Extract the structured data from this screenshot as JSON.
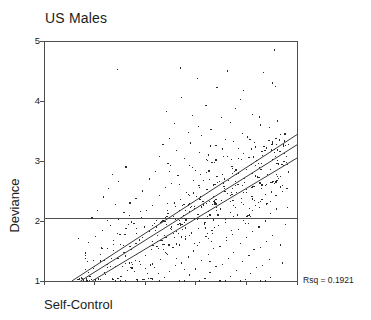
{
  "chart_data": {
    "type": "scatter",
    "title": "US Males",
    "xlabel": "Self-Control",
    "ylabel": "Deviance",
    "annotation": "Rsq = 0.1921",
    "rsq": 0.1921,
    "grid": false,
    "legend": "none",
    "xlim": [
      0,
      5
    ],
    "ylim": [
      1,
      5
    ],
    "x_tick_labels": [
      "",
      "",
      "",
      "",
      "",
      ""
    ],
    "x_tick_values": [
      0,
      1,
      2,
      3,
      4,
      5
    ],
    "y_tick_labels": [
      "1",
      "2",
      "3",
      "4",
      "5"
    ],
    "y_tick_values": [
      1,
      2,
      3,
      4,
      5
    ],
    "reference_lines": [
      {
        "name": "horizontal-mean-line",
        "orientation": "horizontal",
        "y": 2.04
      }
    ],
    "fit_lines": [
      {
        "name": "regression-line-upper",
        "x1": 0.55,
        "y1": 1.0,
        "x2": 5.0,
        "y2": 3.44
      },
      {
        "name": "regression-line-center",
        "x1": 0.72,
        "y1": 1.0,
        "x2": 5.0,
        "y2": 3.27
      },
      {
        "name": "regression-line-lower",
        "x1": 0.95,
        "y1": 1.0,
        "x2": 5.0,
        "y2": 3.05
      }
    ],
    "point_count": 546,
    "points": [
      [
        4.55,
        4.85
      ],
      [
        1.45,
        4.52
      ],
      [
        2.7,
        4.55
      ],
      [
        3.62,
        4.5
      ],
      [
        4.33,
        4.48
      ],
      [
        3.03,
        4.38
      ],
      [
        4.52,
        4.3
      ],
      [
        4.58,
        4.24
      ],
      [
        3.42,
        4.22
      ],
      [
        3.95,
        4.18
      ],
      [
        5.0,
        4.16
      ],
      [
        2.72,
        4.06
      ],
      [
        3.88,
        4.02
      ],
      [
        2.42,
        3.82
      ],
      [
        3.2,
        3.92
      ],
      [
        3.78,
        3.88
      ],
      [
        2.93,
        3.76
      ],
      [
        3.5,
        3.72
      ],
      [
        4.12,
        3.78
      ],
      [
        2.58,
        3.62
      ],
      [
        3.05,
        3.58
      ],
      [
        3.68,
        3.64
      ],
      [
        4.28,
        3.6
      ],
      [
        2.85,
        3.48
      ],
      [
        3.3,
        3.52
      ],
      [
        3.92,
        3.46
      ],
      [
        2.48,
        3.38
      ],
      [
        3.12,
        3.42
      ],
      [
        3.58,
        3.36
      ],
      [
        4.02,
        3.4
      ],
      [
        2.35,
        3.28
      ],
      [
        2.9,
        3.3
      ],
      [
        3.4,
        3.26
      ],
      [
        3.75,
        3.32
      ],
      [
        4.18,
        3.24
      ],
      [
        2.62,
        3.18
      ],
      [
        3.08,
        3.14
      ],
      [
        3.52,
        3.2
      ],
      [
        3.95,
        3.12
      ],
      [
        2.28,
        3.08
      ],
      [
        2.78,
        3.04
      ],
      [
        3.25,
        3.1
      ],
      [
        3.7,
        3.02
      ],
      [
        4.05,
        3.06
      ],
      [
        1.62,
        2.9
      ],
      [
        2.45,
        2.96
      ],
      [
        2.88,
        2.92
      ],
      [
        3.32,
        2.98
      ],
      [
        3.72,
        2.88
      ],
      [
        4.1,
        2.94
      ],
      [
        4.48,
        2.86
      ],
      [
        1.35,
        2.78
      ],
      [
        2.2,
        2.82
      ],
      [
        2.65,
        2.76
      ],
      [
        3.0,
        2.84
      ],
      [
        3.42,
        2.74
      ],
      [
        3.85,
        2.8
      ],
      [
        4.25,
        2.72
      ],
      [
        1.48,
        2.66
      ],
      [
        2.08,
        2.7
      ],
      [
        2.52,
        2.62
      ],
      [
        2.95,
        2.68
      ],
      [
        3.35,
        2.6
      ],
      [
        3.78,
        2.66
      ],
      [
        4.15,
        2.58
      ],
      [
        4.52,
        2.64
      ],
      [
        1.28,
        2.54
      ],
      [
        1.95,
        2.5
      ],
      [
        2.4,
        2.56
      ],
      [
        2.82,
        2.48
      ],
      [
        3.22,
        2.52
      ],
      [
        3.62,
        2.46
      ],
      [
        4.0,
        2.52
      ],
      [
        4.38,
        2.44
      ],
      [
        1.18,
        2.4
      ],
      [
        1.82,
        2.38
      ],
      [
        2.28,
        2.42
      ],
      [
        2.7,
        2.36
      ],
      [
        3.1,
        2.4
      ],
      [
        3.5,
        2.34
      ],
      [
        3.9,
        2.38
      ],
      [
        4.28,
        2.32
      ],
      [
        1.42,
        2.28
      ],
      [
        1.7,
        2.3
      ],
      [
        2.15,
        2.26
      ],
      [
        2.58,
        2.3
      ],
      [
        2.98,
        2.24
      ],
      [
        3.38,
        2.28
      ],
      [
        3.78,
        2.22
      ],
      [
        4.18,
        2.26
      ],
      [
        4.6,
        2.2
      ],
      [
        1.05,
        2.18
      ],
      [
        1.58,
        2.14
      ],
      [
        2.02,
        2.18
      ],
      [
        2.45,
        2.12
      ],
      [
        2.88,
        2.16
      ],
      [
        3.28,
        2.1
      ],
      [
        3.68,
        2.14
      ],
      [
        4.08,
        2.08
      ],
      [
        4.48,
        2.12
      ],
      [
        0.95,
        2.05
      ],
      [
        1.48,
        2.02
      ],
      [
        1.92,
        2.06
      ],
      [
        2.35,
        2.0
      ],
      [
        2.78,
        2.04
      ],
      [
        3.18,
        1.98
      ],
      [
        3.58,
        2.02
      ],
      [
        3.98,
        1.96
      ],
      [
        4.38,
        2.0
      ],
      [
        4.78,
        1.94
      ],
      [
        1.32,
        1.92
      ],
      [
        1.78,
        1.96
      ],
      [
        2.22,
        1.9
      ],
      [
        2.65,
        1.94
      ],
      [
        3.05,
        1.88
      ],
      [
        3.45,
        1.92
      ],
      [
        3.85,
        1.86
      ],
      [
        4.25,
        1.9
      ],
      [
        1.15,
        1.84
      ],
      [
        1.62,
        1.88
      ],
      [
        2.08,
        1.82
      ],
      [
        2.52,
        1.86
      ],
      [
        2.92,
        1.8
      ],
      [
        3.32,
        1.84
      ],
      [
        3.72,
        1.78
      ],
      [
        4.12,
        1.82
      ],
      [
        4.52,
        1.76
      ],
      [
        1.02,
        1.74
      ],
      [
        1.5,
        1.78
      ],
      [
        1.95,
        1.72
      ],
      [
        2.38,
        1.76
      ],
      [
        2.8,
        1.7
      ],
      [
        3.2,
        1.74
      ],
      [
        3.6,
        1.68
      ],
      [
        4.0,
        1.72
      ],
      [
        4.4,
        1.66
      ],
      [
        0.88,
        1.64
      ],
      [
        1.38,
        1.68
      ],
      [
        1.82,
        1.62
      ],
      [
        2.25,
        1.66
      ],
      [
        2.68,
        1.6
      ],
      [
        3.08,
        1.64
      ],
      [
        3.48,
        1.58
      ],
      [
        3.88,
        1.62
      ],
      [
        4.28,
        1.56
      ],
      [
        4.68,
        1.6
      ],
      [
        1.25,
        1.54
      ],
      [
        1.7,
        1.58
      ],
      [
        2.12,
        1.52
      ],
      [
        2.55,
        1.56
      ],
      [
        2.95,
        1.5
      ],
      [
        3.35,
        1.54
      ],
      [
        3.75,
        1.48
      ],
      [
        4.15,
        1.52
      ],
      [
        1.12,
        1.44
      ],
      [
        1.58,
        1.48
      ],
      [
        2.0,
        1.42
      ],
      [
        2.42,
        1.46
      ],
      [
        2.85,
        1.4
      ],
      [
        3.25,
        1.44
      ],
      [
        3.65,
        1.38
      ],
      [
        4.05,
        1.42
      ],
      [
        4.45,
        1.36
      ],
      [
        0.98,
        1.34
      ],
      [
        1.45,
        1.38
      ],
      [
        1.88,
        1.32
      ],
      [
        2.3,
        1.36
      ],
      [
        2.72,
        1.3
      ],
      [
        3.12,
        1.34
      ],
      [
        3.52,
        1.28
      ],
      [
        3.92,
        1.32
      ],
      [
        4.32,
        1.26
      ],
      [
        4.72,
        1.3
      ],
      [
        1.32,
        1.24
      ],
      [
        1.75,
        1.28
      ],
      [
        2.18,
        1.22
      ],
      [
        2.6,
        1.26
      ],
      [
        3.0,
        1.2
      ],
      [
        3.4,
        1.24
      ],
      [
        3.8,
        1.18
      ],
      [
        4.2,
        1.22
      ],
      [
        1.2,
        1.14
      ],
      [
        1.65,
        1.18
      ],
      [
        2.05,
        1.12
      ],
      [
        2.48,
        1.16
      ],
      [
        2.88,
        1.1
      ],
      [
        3.28,
        1.14
      ],
      [
        3.68,
        1.08
      ],
      [
        4.08,
        1.12
      ],
      [
        4.48,
        1.06
      ],
      [
        1.08,
        1.04
      ],
      [
        1.52,
        1.08
      ],
      [
        1.95,
        1.02
      ],
      [
        2.38,
        1.06
      ],
      [
        2.78,
        1.0
      ],
      [
        3.18,
        1.04
      ],
      [
        3.58,
        1.0
      ],
      [
        3.98,
        1.02
      ],
      [
        4.38,
        1.0
      ],
      [
        0.85,
        1.0
      ],
      [
        1.42,
        1.0
      ],
      [
        1.85,
        1.0
      ],
      [
        2.28,
        1.0
      ],
      [
        2.68,
        1.0
      ],
      [
        3.08,
        1.0
      ],
      [
        3.48,
        1.0
      ],
      [
        3.88,
        1.0
      ],
      [
        4.28,
        1.0
      ]
    ]
  },
  "axes": {
    "title": "US Males",
    "x_axis_label": "Self-Control",
    "y_axis_label": "Deviance",
    "y_ticks": [
      "5",
      "4",
      "3",
      "2",
      "1"
    ],
    "annotation_label": "Rsq = 0.1921"
  },
  "colors": {
    "axis": "#4d4d4d",
    "point": "#2b2b2b",
    "line": "#3a3a3a",
    "text": "#1c1c1c",
    "background": "#ffffff"
  }
}
